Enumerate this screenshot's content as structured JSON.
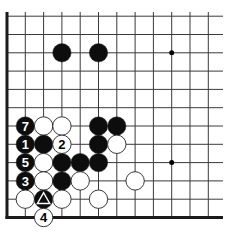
{
  "diagram": {
    "type": "go-board-fragment",
    "grid": {
      "origin_x": 7,
      "origin_y": 217.5,
      "spacing": 18.3,
      "cols": 12,
      "rows": 12,
      "right_extent": 223,
      "top_extent": 12,
      "line_color": "#3a3a3a",
      "edge_color": "#1a1a1a"
    },
    "star_points": [
      {
        "col": 9,
        "row": 9
      },
      {
        "col": 9,
        "row": 3
      }
    ],
    "stones": [
      {
        "color": "black",
        "col": 3,
        "row": 9,
        "label": ""
      },
      {
        "color": "black",
        "col": 5,
        "row": 9,
        "label": ""
      },
      {
        "color": "black",
        "col": 1,
        "row": 5,
        "label": "7"
      },
      {
        "color": "white",
        "col": 2,
        "row": 5,
        "label": ""
      },
      {
        "color": "white",
        "col": 3,
        "row": 5,
        "label": ""
      },
      {
        "color": "black",
        "col": 5,
        "row": 5,
        "label": ""
      },
      {
        "color": "black",
        "col": 6,
        "row": 5,
        "label": ""
      },
      {
        "color": "black",
        "col": 1,
        "row": 4,
        "label": "1"
      },
      {
        "color": "black",
        "col": 2,
        "row": 4,
        "label": ""
      },
      {
        "color": "white",
        "col": 3,
        "row": 4,
        "label": "2"
      },
      {
        "color": "black",
        "col": 5,
        "row": 4,
        "label": ""
      },
      {
        "color": "white",
        "col": 6,
        "row": 4,
        "label": ""
      },
      {
        "color": "black",
        "col": 1,
        "row": 3,
        "label": "5"
      },
      {
        "color": "white",
        "col": 2,
        "row": 3,
        "label": ""
      },
      {
        "color": "black",
        "col": 3,
        "row": 3,
        "label": ""
      },
      {
        "color": "black",
        "col": 4,
        "row": 3,
        "label": ""
      },
      {
        "color": "black",
        "col": 5,
        "row": 3,
        "label": ""
      },
      {
        "color": "black",
        "col": 1,
        "row": 2,
        "label": "3"
      },
      {
        "color": "white",
        "col": 2,
        "row": 2,
        "label": ""
      },
      {
        "color": "black",
        "col": 3,
        "row": 2,
        "label": ""
      },
      {
        "color": "white",
        "col": 4,
        "row": 2,
        "label": ""
      },
      {
        "color": "white",
        "col": 7,
        "row": 2,
        "label": ""
      },
      {
        "color": "white",
        "col": 1,
        "row": 1,
        "label": ""
      },
      {
        "color": "black",
        "col": 2,
        "row": 1,
        "label": "",
        "marker": "triangle"
      },
      {
        "color": "white",
        "col": 3,
        "row": 1,
        "label": ""
      },
      {
        "color": "white",
        "col": 5,
        "row": 1,
        "label": ""
      },
      {
        "color": "white",
        "col": 2,
        "row": 0,
        "label": "4"
      }
    ],
    "stone_radius": 9.2,
    "colors": {
      "black": "#0d0d0d",
      "white": "#ffffff",
      "stone_outline": "#222222"
    }
  }
}
